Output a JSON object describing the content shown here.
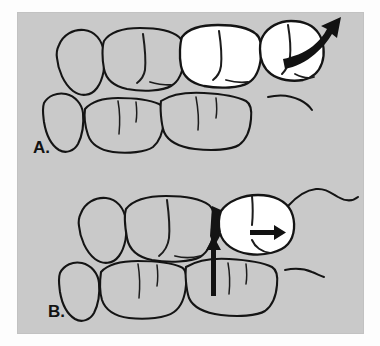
{
  "figure": {
    "background_color": "#c9c9c9",
    "page_color": "#fdfdfd",
    "ink_color": "#141414",
    "highlight_fill": "#ffffff",
    "panels": [
      {
        "id": "A",
        "label": "A.",
        "description": "Upper and lower molar rows with two white (highlighted) upper teeth; a curved arrow points up and to the right from the distal-most white tooth indicating tipping / drifting movement.",
        "highlighted_teeth": 2,
        "arrows": [
          {
            "name": "curved-drift-arrow",
            "direction": "up-right",
            "style": "curved-solid"
          }
        ]
      },
      {
        "id": "B",
        "label": "B.",
        "description": "Upper and lower molar rows with one white (highlighted) upper tooth tipped mesially; a horizontal arrow inside the white tooth points right and a vertical arrow below points up into the contact area. A dark triangular wedge marks the opened contact.",
        "highlighted_teeth": 1,
        "arrows": [
          {
            "name": "horizontal-drift-arrow",
            "direction": "right",
            "style": "straight-solid"
          },
          {
            "name": "vertical-eruption-arrow",
            "direction": "up",
            "style": "straight-solid"
          }
        ]
      }
    ]
  }
}
